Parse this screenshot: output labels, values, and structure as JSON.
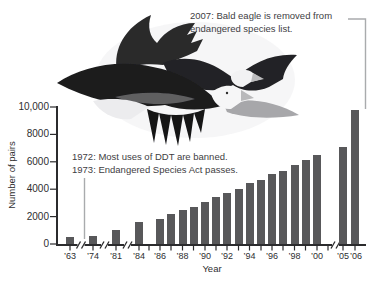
{
  "annotations": {
    "eagle_removed": {
      "line1": "2007: Bald eagle is removed from",
      "line2": "endangered species list."
    },
    "ddt_banned": "1972: Most uses of DDT are banned.",
    "esa_passes": "1973: Endangered Species Act passes."
  },
  "image": {
    "description": "Two bald eagles in flight"
  },
  "colors": {
    "bar": "#58585a",
    "axis": "#2b2b2d",
    "connector": "#a9abad",
    "text": "#414043"
  },
  "chart_data": {
    "type": "bar",
    "title": "",
    "xlabel": "Year",
    "ylabel": "Number of pairs",
    "ylim": [
      0,
      10000
    ],
    "grid": false,
    "legend": "none",
    "ytick_values": [
      0,
      2000,
      4000,
      6000,
      8000,
      10000
    ],
    "ytick_labels": [
      "0",
      "2000",
      "4000",
      "6000",
      "8000",
      "10,000"
    ],
    "categories": [
      "1963",
      "1974",
      "1981",
      "1984",
      "1986",
      "1987",
      "1988",
      "1989",
      "1990",
      "1991",
      "1992",
      "1993",
      "1994",
      "1995",
      "1996",
      "1997",
      "1998",
      "1999",
      "2000",
      "2005",
      "2006"
    ],
    "values": [
      500,
      550,
      1050,
      1600,
      1850,
      2200,
      2450,
      2680,
      3040,
      3400,
      3750,
      4050,
      4450,
      4700,
      5100,
      5300,
      5750,
      6100,
      6470,
      7070,
      9790
    ],
    "xtick_labels": [
      "’63",
      "’74",
      "’81",
      "’84",
      "’86",
      "’88",
      "’90",
      "’92",
      "’94",
      "’96",
      "’98",
      "’00",
      "’05",
      "’06"
    ],
    "axis_breaks": [
      "1963|1974",
      "1974|1981",
      "1981|1984",
      "2001|2005"
    ]
  }
}
